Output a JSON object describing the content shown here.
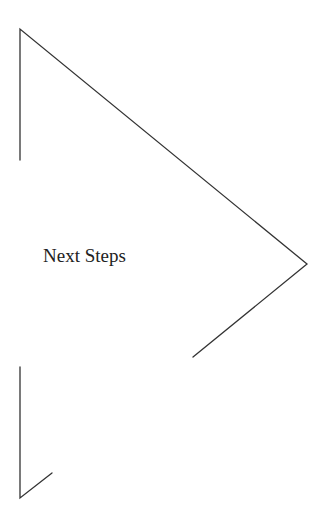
{
  "diagram": {
    "shape": "chevron-arrow",
    "label": "Next Steps",
    "stroke_color": "#333333",
    "background": "#ffffff"
  }
}
